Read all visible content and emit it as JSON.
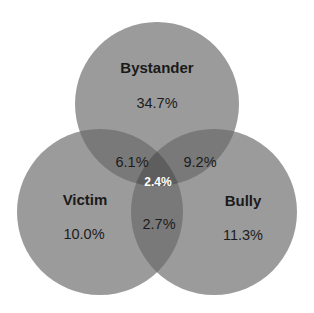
{
  "diagram": {
    "type": "venn",
    "colors": {
      "background": "#ffffff",
      "single": "#9b9b9b",
      "double": "#797979",
      "triple": "#5e5e5e",
      "text": "#1a1a1a",
      "center_text": "#ffffff"
    },
    "sets": [
      {
        "id": "bystander",
        "label": "Bystander",
        "only_pct": "34.7%",
        "cx": 157,
        "cy": 104,
        "r": 82
      },
      {
        "id": "victim",
        "label": "Victim",
        "only_pct": "10.0%",
        "cx": 100,
        "cy": 212,
        "r": 83
      },
      {
        "id": "bully",
        "label": "Bully",
        "only_pct": "11.3%",
        "cx": 214,
        "cy": 212,
        "r": 83
      }
    ],
    "intersections": {
      "bystander_victim": "6.1%",
      "bystander_bully": "9.2%",
      "victim_bully": "2.7%",
      "all_three": "2.4%"
    }
  }
}
